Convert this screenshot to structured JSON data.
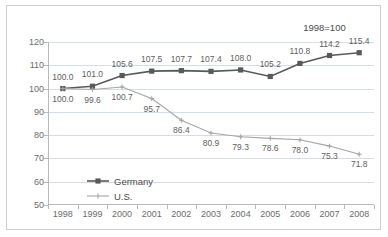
{
  "chart_data": {
    "type": "line",
    "title": "",
    "subtitle": "",
    "annotation": "1998=100",
    "xlabel": "",
    "ylabel": "",
    "categories": [
      "1998",
      "1999",
      "2000",
      "2001",
      "2002",
      "2003",
      "2004",
      "2005",
      "2006",
      "2007",
      "2008"
    ],
    "ylim": [
      50,
      120
    ],
    "yticks": [
      50,
      60,
      70,
      80,
      90,
      100,
      110,
      120
    ],
    "ytick_labels": [
      "50",
      "60",
      "70",
      "80",
      "90",
      "100",
      "110",
      "120"
    ],
    "grid": true,
    "legend_position": "inside-lower-left",
    "series": [
      {
        "name": "Germany",
        "color": "#595959",
        "marker": "square",
        "values": [
          100.0,
          101.0,
          105.6,
          107.5,
          107.7,
          107.4,
          108.0,
          105.2,
          110.8,
          114.2,
          115.4
        ],
        "labels": [
          "100.0",
          "101.0",
          "105.6",
          "107.5",
          "107.7",
          "107.4",
          "108.0",
          "105.2",
          "110.8",
          "114.2",
          "115.4"
        ],
        "label_position": "above"
      },
      {
        "name": "U.S.",
        "color": "#a6a6a6",
        "marker": "cross",
        "values": [
          100.0,
          99.6,
          100.7,
          95.7,
          86.4,
          80.9,
          79.3,
          78.6,
          78.0,
          75.3,
          71.8
        ],
        "labels": [
          "100.0",
          "99.6",
          "100.7",
          "95.7",
          "86.4",
          "80.9",
          "79.3",
          "78.6",
          "78.0",
          "75.3",
          "71.8"
        ],
        "label_position": "below"
      }
    ],
    "colors": {
      "germany": "#595959",
      "us": "#a6a6a6",
      "grid": "#d6dde6",
      "axis": "#b9b9b9",
      "text": "#6b6b6b",
      "border": "#cfcfcf"
    }
  }
}
